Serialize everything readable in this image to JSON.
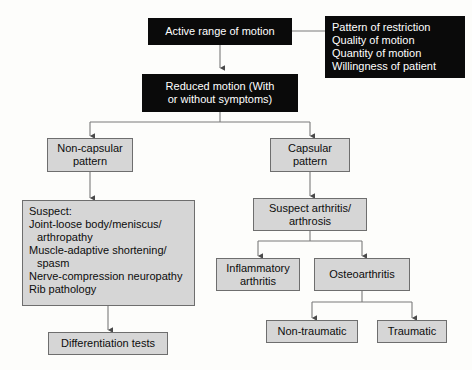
{
  "diagram": {
    "colors": {
      "dark_box_fill": "#0a0a0a",
      "dark_box_text": "#ffffff",
      "grey_box_fill": "#d6d6d6",
      "grey_box_border": "#6e6e6e",
      "connector": "#7a7a7a",
      "background": "#fdfdfb"
    },
    "nodes": {
      "active_range": {
        "lines": [
          "Active range of motion"
        ]
      },
      "restriction_criteria": {
        "lines": [
          "Pattern of restriction",
          "Quality of motion",
          "Quantity of motion",
          "Willingness of patient"
        ]
      },
      "reduced_motion": {
        "lines": [
          "Reduced motion (With",
          "or without symptoms)"
        ]
      },
      "non_capsular": {
        "lines": [
          "Non-capsular",
          "pattern"
        ]
      },
      "capsular": {
        "lines": [
          "Capsular",
          "pattern"
        ]
      },
      "suspect_list": {
        "lines": [
          "Suspect:",
          "Joint-loose body/meniscus/",
          "arthropathy",
          "Muscle-adaptive shortening/",
          "spasm",
          "Nerve-compression neuropathy",
          "Rib pathology"
        ],
        "indented": [
          2,
          4
        ]
      },
      "differentiation_tests": {
        "lines": [
          "Differentiation tests"
        ]
      },
      "suspect_arthritis": {
        "lines": [
          "Suspect arthritis/",
          "arthrosis"
        ]
      },
      "inflammatory_arthritis": {
        "lines": [
          "Inflammatory",
          "arthritis"
        ]
      },
      "osteoarthritis": {
        "lines": [
          "Osteoarthritis"
        ]
      },
      "non_traumatic": {
        "lines": [
          "Non-traumatic"
        ]
      },
      "traumatic": {
        "lines": [
          "Traumatic"
        ]
      }
    }
  }
}
